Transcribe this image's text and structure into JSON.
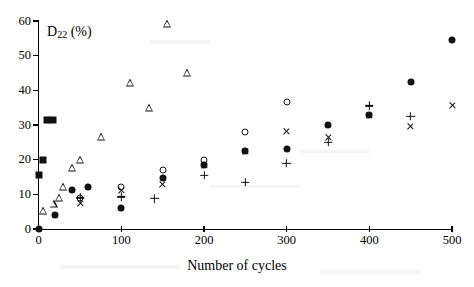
{
  "chart_data": {
    "type": "scatter",
    "title": "",
    "xlabel": "Number of cycles",
    "ylabel": "D22 (%)",
    "ylabel_display": "D",
    "ylabel_sub": "22",
    "ylabel_unit": " (%)",
    "xlim": [
      0,
      500
    ],
    "ylim": [
      0,
      60
    ],
    "xticks": [
      0,
      100,
      200,
      300,
      400,
      500
    ],
    "yticks": [
      0,
      10,
      20,
      30,
      40,
      50,
      60
    ],
    "xtick_labels": [
      "0",
      "100",
      "200",
      "300",
      "400",
      "500"
    ],
    "ytick_labels": [
      "0",
      "10",
      "20",
      "30",
      "40",
      "50",
      "60"
    ],
    "grid": false,
    "legend": "none",
    "series": [
      {
        "name": "filled-square",
        "marker": "filled-square",
        "points": [
          [
            0,
            15.5
          ],
          [
            5,
            20.0
          ],
          [
            10,
            31.5
          ],
          [
            17,
            31.3
          ]
        ]
      },
      {
        "name": "filled-circle",
        "marker": "filled-circle",
        "points": [
          [
            0,
            0.0
          ],
          [
            20,
            4.0
          ],
          [
            40,
            11.3
          ],
          [
            60,
            12.2
          ],
          [
            100,
            6.1
          ],
          [
            150,
            14.7
          ],
          [
            200,
            18.5
          ],
          [
            250,
            22.5
          ],
          [
            300,
            23.0
          ],
          [
            350,
            30.0
          ],
          [
            400,
            33.0
          ],
          [
            450,
            42.5
          ],
          [
            500,
            54.5
          ]
        ]
      },
      {
        "name": "open-circle",
        "marker": "open-circle",
        "points": [
          [
            50,
            8.8
          ],
          [
            100,
            12.0
          ],
          [
            150,
            17.0
          ],
          [
            200,
            20.0
          ],
          [
            250,
            28.0
          ],
          [
            300,
            36.5
          ]
        ]
      },
      {
        "name": "open-triangle",
        "marker": "open-triangle",
        "points": [
          [
            5,
            5.3
          ],
          [
            18,
            7.3
          ],
          [
            25,
            9.0
          ],
          [
            30,
            12.0
          ],
          [
            40,
            17.5
          ],
          [
            50,
            20.0
          ],
          [
            75,
            26.5
          ],
          [
            110,
            42.0
          ],
          [
            133,
            35.0
          ],
          [
            155,
            59.0
          ],
          [
            180,
            45.0
          ]
        ]
      },
      {
        "name": "cross",
        "marker": "cross",
        "points": [
          [
            50,
            7.3
          ],
          [
            100,
            11.0
          ],
          [
            150,
            12.8
          ],
          [
            200,
            18.3
          ],
          [
            250,
            22.3
          ],
          [
            300,
            28.0
          ],
          [
            350,
            26.5
          ],
          [
            400,
            32.8
          ],
          [
            450,
            29.5
          ],
          [
            500,
            35.5
          ]
        ]
      },
      {
        "name": "plus",
        "marker": "plus",
        "points": [
          [
            50,
            9.0
          ],
          [
            100,
            9.3
          ],
          [
            140,
            8.8
          ],
          [
            200,
            15.5
          ],
          [
            250,
            13.5
          ],
          [
            300,
            19.0
          ],
          [
            350,
            25.0
          ],
          [
            400,
            35.5
          ],
          [
            450,
            32.5
          ]
        ]
      }
    ]
  },
  "axes": {
    "x_title": "Number of cycles",
    "y_title_main": "D",
    "y_title_sub": "22",
    "y_title_unit": "(%)"
  }
}
